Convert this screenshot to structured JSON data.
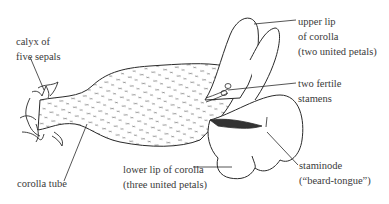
{
  "diagram": {
    "labels": {
      "calyx": [
        "calyx of",
        "five sepals"
      ],
      "corolla_tube": [
        "corolla tube"
      ],
      "lower_lip": [
        "lower lip of corolla",
        "(three united petals)"
      ],
      "upper_lip": [
        "upper lip",
        "of corolla",
        "(two united petals)"
      ],
      "stamens": [
        "two fertile",
        "stamens"
      ],
      "staminode": [
        "staminode",
        "(“beard-tongue”)"
      ]
    },
    "colors": {
      "ink": "#2a2a2a",
      "text": "#3a3a3a",
      "background": "#ffffff"
    }
  }
}
